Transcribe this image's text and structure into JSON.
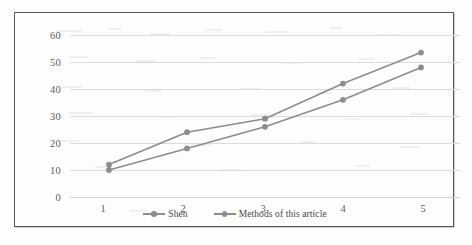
{
  "figure": {
    "background_color": "#fdfdfc",
    "frame_color": "#585858",
    "gridline_color": "#dcdcdc"
  },
  "chart_data": {
    "type": "line",
    "title": "",
    "subtitle": "",
    "xlabel": "",
    "ylabel": "",
    "categories": [
      "1",
      "2",
      "3",
      "4",
      "5"
    ],
    "series": [
      {
        "name": "Shen",
        "color": "#8d8d8d",
        "values": [
          10,
          18,
          26,
          36,
          48
        ]
      },
      {
        "name": "Methods of this article",
        "color": "#8d8d8d",
        "values": [
          12,
          24,
          29,
          42,
          53.5
        ]
      }
    ],
    "ylim": [
      0,
      60
    ],
    "ytick_labels": [
      "0",
      "10",
      "20",
      "30",
      "40",
      "50",
      "60"
    ],
    "ytick_values": [
      0,
      10,
      20,
      30,
      40,
      50,
      60
    ],
    "xtick_labels": [
      "1",
      "2",
      "3",
      "4",
      "5"
    ],
    "grid": true,
    "grid_axis": "y",
    "legend_position": "bottom-center",
    "marker": "circle",
    "marker_color": "#8d8d8d",
    "line_width": 1.6
  },
  "legend": {
    "items": [
      {
        "label": "Shen"
      },
      {
        "label": "Methods of this article"
      }
    ]
  }
}
